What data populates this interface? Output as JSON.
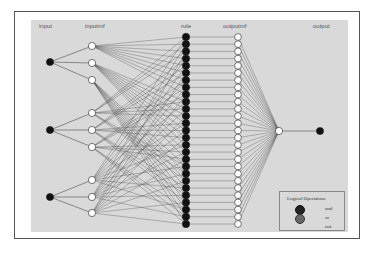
{
  "diagram": {
    "type": "ANFIS network structure",
    "layers": [
      {
        "key": "input",
        "label": "input",
        "count": 3,
        "node_color": "#111111"
      },
      {
        "key": "inputmf",
        "label": "inputmf",
        "count": 9,
        "node_color": "#ffffff"
      },
      {
        "key": "rule",
        "label": "rule",
        "count": 27,
        "node_color": "#111111"
      },
      {
        "key": "outputmf",
        "label": "outputmf",
        "count": 27,
        "node_color": "#ffffff"
      },
      {
        "key": "aggregation",
        "label": "",
        "count": 1,
        "node_color": "#ffffff"
      },
      {
        "key": "output",
        "label": "output",
        "count": 1,
        "node_color": "#111111"
      }
    ],
    "labels": {
      "input": "input",
      "inputmf": "inputmf",
      "rule": "rule",
      "outputmf": "outputmf",
      "output": "output"
    },
    "mfs_per_input": 3,
    "legend": {
      "title": "Logical Operations",
      "items": [
        {
          "label": "and",
          "color": "#222222"
        },
        {
          "label": "or",
          "color": "#666666"
        },
        {
          "label": "not",
          "color": ""
        }
      ]
    },
    "colors": {
      "panel": "#d9d9d9",
      "edge": "#444444",
      "frame_border": "#555555"
    }
  }
}
